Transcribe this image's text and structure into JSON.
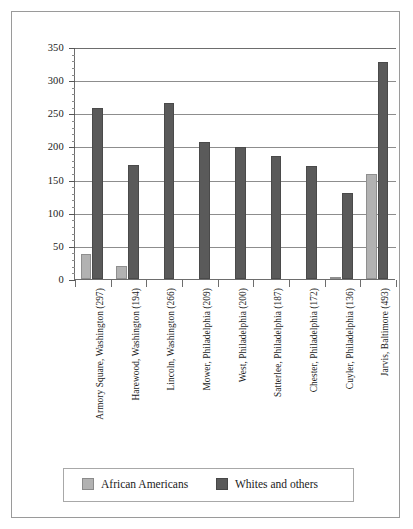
{
  "chart_data": {
    "type": "bar",
    "title": "",
    "xlabel": "",
    "ylabel": "",
    "ylim": [
      0,
      350
    ],
    "ytick_step": 50,
    "yticks": [
      0,
      50,
      100,
      150,
      200,
      250,
      300,
      350
    ],
    "grid": true,
    "legend_position": "bottom",
    "categories": [
      "Armory Square, Washington (297)",
      "Harewood, Washington (194)",
      "Lincoln, Washington (266)",
      "Mower, Philadelphia (209)",
      "West, Philadelphia (200)",
      "Satterlee, Philadelphia (187)",
      "Chester, Philadelphia (172)",
      "Cuyler, Philadelphia (136)",
      "Jarvis, Baltimore (493)"
    ],
    "series": [
      {
        "name": "African Americans",
        "color": "#b2b2b2",
        "values": [
          38,
          20,
          0,
          0,
          0,
          0,
          0,
          3,
          158
        ]
      },
      {
        "name": "Whites and others",
        "color": "#5a5a5a",
        "values": [
          258,
          172,
          265,
          207,
          199,
          185,
          170,
          130,
          328
        ]
      }
    ]
  },
  "legend": {
    "items": [
      {
        "label": "African Americans",
        "swatch": "aa"
      },
      {
        "label": "Whites and others",
        "swatch": "wo"
      }
    ]
  }
}
